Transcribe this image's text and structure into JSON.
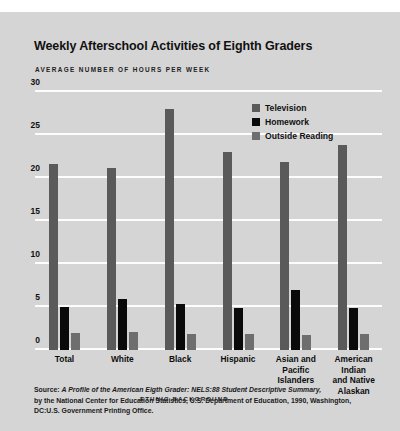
{
  "page_header": {
    "running_head": "",
    "folio": ""
  },
  "chart_data": {
    "type": "bar",
    "title": "Weekly Afterschool Activities of Eighth Graders",
    "subtitle": "AVERAGE NUMBER OF HOURS PER WEEK",
    "xlabel": "ETHNIC BACKGROUND",
    "ylabel": "",
    "ylim": [
      0,
      30
    ],
    "yticks": [
      0,
      5,
      10,
      15,
      20,
      25,
      30
    ],
    "ytick_labels": [
      "0",
      "5",
      "10",
      "15",
      "20",
      "25",
      "30"
    ],
    "grid": true,
    "legend_position": "top-right",
    "categories": [
      "Total",
      "White",
      "Black",
      "Hispanic",
      "Asian and\nPacific\nIslanders",
      "American\nIndian\nand Native\nAlaskan"
    ],
    "series": [
      {
        "name": "Television",
        "color": "#5a5a5a",
        "values": [
          21.6,
          21.2,
          28.0,
          23.0,
          21.9,
          23.8
        ]
      },
      {
        "name": "Homework",
        "color": "#0a0a0a",
        "values": [
          5.0,
          5.9,
          5.4,
          4.9,
          7.0,
          4.9
        ]
      },
      {
        "name": "Outside Reading",
        "color": "#6e6e6e",
        "values": [
          2.0,
          2.1,
          1.9,
          1.9,
          1.8,
          1.9
        ]
      }
    ]
  },
  "source_note": {
    "line1_prefix": "Source: ",
    "line1_italic": "A Profile of the American Eigth Grader: NELS:88 Student Descriptive Summary,",
    "line2": "by the National Center for Education Statistics, U.S. Department of Education, 1990, Washington,",
    "line3": "DC:U.S. Government Printing Office."
  },
  "colors": {
    "panel_background": "#d5d5d5",
    "page_background": "#ffffff",
    "gridline": "#fdfdfd",
    "television": "#5a5a5a",
    "homework": "#0a0a0a",
    "outside_reading": "#6e6e6e",
    "text": "#111111"
  }
}
